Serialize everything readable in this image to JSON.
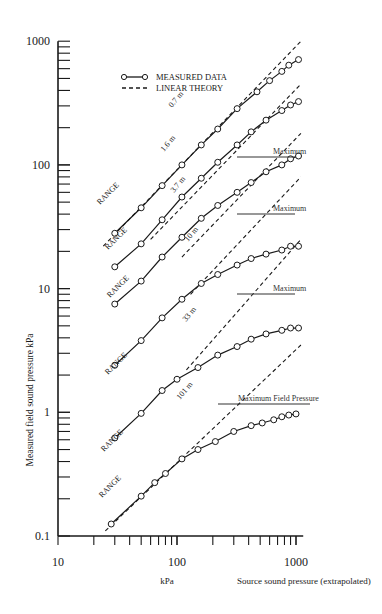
{
  "chart_data": {
    "type": "line",
    "title": "",
    "xlabel": "Source sound pressure (extrapolated)",
    "xlabel_unit": "kPa",
    "ylabel": "Measured field sound pressure  kPa",
    "xscale": "log",
    "yscale": "log",
    "xlim": [
      10,
      1000
    ],
    "ylim": [
      0.1,
      1000
    ],
    "x_tick_labels": [
      "10",
      "100",
      "1000"
    ],
    "y_tick_labels": [
      "0.1",
      "1",
      "10",
      "100",
      "1000"
    ],
    "grid": false,
    "legend": {
      "position": "upper left",
      "entries": [
        {
          "label": "MEASURED DATA",
          "style": "solid line with open circles"
        },
        {
          "label": "LINEAR THEORY",
          "style": "dashed line"
        }
      ]
    },
    "series": [
      {
        "name": "RANGE 0.7 m",
        "range_label": "0.7 m",
        "x": [
          30,
          50,
          75,
          110,
          160,
          220,
          320,
          470,
          600,
          760,
          870,
          1050
        ],
        "y": [
          28,
          45,
          68,
          100,
          145,
          195,
          285,
          390,
          480,
          570,
          640,
          710
        ],
        "theory_line": {
          "x": [
            24,
            1100
          ],
          "y": [
            22,
            1000
          ]
        }
      },
      {
        "name": "RANGE 1.6 m",
        "range_label": "1.6 m",
        "x": [
          30,
          50,
          75,
          110,
          160,
          220,
          320,
          420,
          560,
          760,
          900,
          1050
        ],
        "y": [
          15,
          23,
          36,
          55,
          78,
          105,
          145,
          185,
          230,
          275,
          305,
          325
        ],
        "theory_line": {
          "x": [
            60,
            1100
          ],
          "y": [
            25,
            450
          ]
        },
        "maximum_label": "Maximum"
      },
      {
        "name": "RANGE 3.7 m",
        "range_label": "3.7 m",
        "x": [
          30,
          50,
          75,
          110,
          160,
          220,
          320,
          420,
          560,
          760,
          900,
          1050
        ],
        "y": [
          7.5,
          11.5,
          18,
          26,
          37,
          47,
          60,
          72,
          88,
          100,
          112,
          118
        ],
        "theory_line": {
          "x": [
            110,
            1100
          ],
          "y": [
            18,
            180
          ]
        }
      },
      {
        "name": "RANGE 10 m",
        "range_label": "10 m",
        "x": [
          30,
          50,
          75,
          110,
          160,
          220,
          320,
          420,
          560,
          760,
          900,
          1050
        ],
        "y": [
          2.4,
          3.8,
          5.8,
          8.2,
          11,
          13,
          15.5,
          17.5,
          19,
          20.5,
          22,
          22
        ],
        "theory_line": {
          "x": [
            130,
            1100
          ],
          "y": [
            9,
            80
          ]
        },
        "maximum_label": "Maximum"
      },
      {
        "name": "RANGE 33 m",
        "range_label": "33 m",
        "x": [
          30,
          50,
          75,
          100,
          150,
          220,
          320,
          420,
          560,
          760,
          900,
          1050
        ],
        "y": [
          0.62,
          0.98,
          1.5,
          1.85,
          2.3,
          2.9,
          3.4,
          3.9,
          4.3,
          4.6,
          4.8,
          4.8
        ],
        "theory_line": {
          "x": [
            120,
            1100
          ],
          "y": [
            2.2,
            25
          ]
        },
        "maximum_label": "Maximum"
      },
      {
        "name": "RANGE 101 m",
        "range_label": "101 m",
        "x": [
          28,
          50,
          65,
          80,
          110,
          150,
          210,
          300,
          420,
          520,
          650,
          760,
          870,
          1000
        ],
        "y": [
          0.125,
          0.21,
          0.27,
          0.32,
          0.42,
          0.5,
          0.58,
          0.7,
          0.78,
          0.82,
          0.87,
          0.92,
          0.95,
          0.97
        ],
        "theory_line": {
          "x": [
            25,
            1100
          ],
          "y": [
            0.11,
            3.5
          ]
        },
        "maximum_label": "Maximum Field Pressure"
      }
    ],
    "annotations": [
      "RANGE",
      "0.7 m",
      "1.6 m",
      "3.7 m",
      "10 m",
      "33 m",
      "101 m",
      "Maximum",
      "Maximum",
      "Maximum",
      "Maximum Field Pressure"
    ]
  },
  "labels": {
    "ylabel": "Measured field sound pressure  kPa",
    "xlabel_unit": "kPa",
    "xlabel": "Source sound pressure (extrapolated)",
    "legend_measured": "MEASURED DATA",
    "legend_theory": "LINEAR THEORY",
    "range_word": "RANGE",
    "maximum": "Maximum",
    "maximum_field": "Maximum Field Pressure"
  }
}
